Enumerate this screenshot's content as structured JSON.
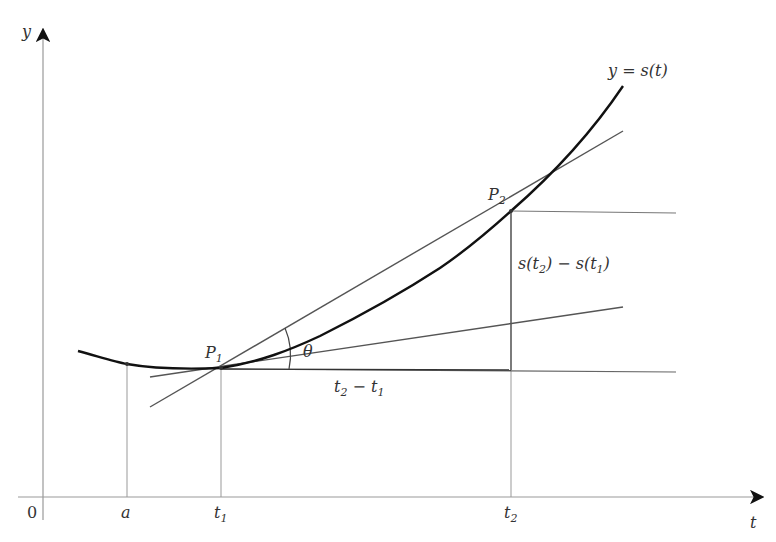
{
  "diagram": {
    "axes": {
      "x_label": "t",
      "y_label": "y",
      "origin_label": "0"
    },
    "curve_label": "y = s(t)",
    "curve_label_parts": {
      "pre": "y = s(",
      "arg": "t",
      "post": ")"
    },
    "points": {
      "p1": {
        "letter": "P",
        "sub": "1"
      },
      "p2": {
        "letter": "P",
        "sub": "2"
      }
    },
    "x_ticks": {
      "a": "a",
      "t1": {
        "letter": "t",
        "sub": "1"
      },
      "t2": {
        "letter": "t",
        "sub": "2"
      }
    },
    "angle_label": "θ",
    "delta_t_label": {
      "t2": "t",
      "sub2": "2",
      "minus": " − ",
      "t1": "t",
      "sub1": "1"
    },
    "delta_s_label": {
      "s1": "s(",
      "t2": "t",
      "sub2": "2",
      "mid": ") − s(",
      "t1": "t",
      "sub1": "1",
      "close": ")"
    },
    "colors": {
      "curve": "#111111",
      "lines": "#555555",
      "axes": "#888888",
      "text": "#333333"
    }
  }
}
